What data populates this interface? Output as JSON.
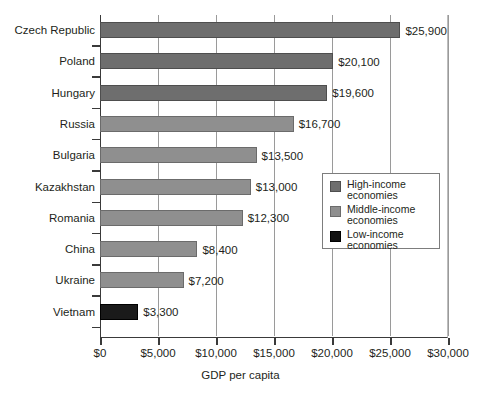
{
  "chart_data": {
    "type": "bar",
    "orientation": "horizontal",
    "title": "",
    "xlabel": "GDP per capita",
    "ylabel": "",
    "xlim": [
      0,
      30000
    ],
    "xticks": [
      "$0",
      "$5,000",
      "$10,000",
      "$15,000",
      "$20,000",
      "$25,000",
      "$30,000"
    ],
    "xtick_values": [
      0,
      5000,
      10000,
      15000,
      20000,
      25000,
      30000
    ],
    "grid": "vertical",
    "legend_position": "middle-right-inside",
    "categories": [
      "Czech Republic",
      "Poland",
      "Hungary",
      "Russia",
      "Bulgaria",
      "Kazakhstan",
      "Romania",
      "China",
      "Ukraine",
      "Vietnam"
    ],
    "values": [
      25900,
      20100,
      19600,
      16700,
      13500,
      13000,
      12300,
      8400,
      7200,
      3300
    ],
    "value_labels": [
      "$25,900",
      "$20,100",
      "$19,600",
      "$16,700",
      "$13,500",
      "$13,000",
      "$12,300",
      "$8,400",
      "$7,200",
      "$3,300"
    ],
    "groups": [
      "high",
      "high",
      "high",
      "middle",
      "middle",
      "middle",
      "middle",
      "middle",
      "middle",
      "low"
    ],
    "series_colors": {
      "high": "#6e6e6e",
      "middle": "#8f8f8f",
      "low": "#1a1a1a"
    }
  },
  "legend": {
    "entries": [
      {
        "key": "high",
        "label_line1": "High-income",
        "label_line2": "economies"
      },
      {
        "key": "middle",
        "label_line1": "Middle-income",
        "label_line2": "economies"
      },
      {
        "key": "low",
        "label_line1": "Low-income",
        "label_line2": "economies"
      }
    ]
  }
}
